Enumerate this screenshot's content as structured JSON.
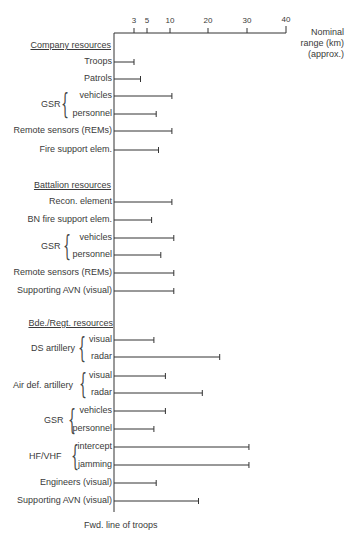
{
  "chart_data": {
    "type": "bar",
    "orientation": "horizontal",
    "title": "",
    "xlabel": "Nominal range (km) (approx.)",
    "ylabel": "",
    "x_ticks": [
      3,
      5,
      10,
      20,
      30,
      40
    ],
    "xlim": [
      0,
      40
    ],
    "grid": false,
    "legend": null,
    "footer": "Fwd. line of troops",
    "groups": [
      {
        "name": "Company resources",
        "items": [
          {
            "label": "Troops",
            "value": 3
          },
          {
            "label": "Patrols",
            "value": 4
          },
          {
            "label": "vehicles",
            "parent": "GSR",
            "value": 10.5
          },
          {
            "label": "personnel",
            "parent": "GSR",
            "value": 7
          },
          {
            "label": "Remote sensors (REMs)",
            "value": 10.5
          },
          {
            "label": "Fire support elem.",
            "value": 7.5
          }
        ]
      },
      {
        "name": "Battalion resources",
        "items": [
          {
            "label": "Recon. element",
            "value": 10.5
          },
          {
            "label": "BN fire support elem.",
            "value": 6
          },
          {
            "label": "vehicles",
            "parent": "GSR",
            "value": 11
          },
          {
            "label": "personnel",
            "parent": "GSR",
            "value": 8
          },
          {
            "label": "Remote sensors (REMs)",
            "value": 11
          },
          {
            "label": "Supporting AVN  (visual)",
            "value": 11
          }
        ]
      },
      {
        "name": "Bde./Regt. resources",
        "items": [
          {
            "label": "visual",
            "parent": "DS artillery",
            "value": 6.5
          },
          {
            "label": "radar",
            "parent": "DS artillery",
            "value": 23
          },
          {
            "label": "visual",
            "parent": "Air def. artillery",
            "value": 9
          },
          {
            "label": "radar",
            "parent": "Air def. artillery",
            "value": 18.5
          },
          {
            "label": "vehicles",
            "parent": "GSR",
            "value": 9
          },
          {
            "label": "personnel",
            "parent": "GSR",
            "value": 6.5
          },
          {
            "label": "intercept",
            "parent": "HF/VHF",
            "value": 30.5
          },
          {
            "label": "jamming",
            "parent": "HF/VHF",
            "value": 30.5
          },
          {
            "label": "Engineers  (visual)",
            "value": 7
          },
          {
            "label": "Supporting AVN (visual)",
            "value": 17.5
          }
        ]
      }
    ]
  },
  "axis": {
    "units_line1": "Nominal",
    "units_line2": "range (km)",
    "units_line3": "(approx.)",
    "ticks": [
      "3",
      "5",
      "10",
      "20",
      "30",
      "40"
    ]
  },
  "headers": {
    "company": "Company resources",
    "battalion": "Battalion resources",
    "brigade": "Bde./Regt. resources"
  },
  "brace_labels": {
    "gsr1": "GSR",
    "gsr2": "GSR",
    "ds": "DS artillery",
    "ad": "Air def. artillery",
    "gsr3": "GSR",
    "hf": "HF/VHF"
  },
  "footer": "Fwd. line of troops",
  "rows": [
    {
      "label": "Troops",
      "y": 62,
      "value": 3
    },
    {
      "label": "Patrols",
      "y": 79,
      "value": 4
    },
    {
      "label": "vehicles",
      "y": 96,
      "value": 10.5
    },
    {
      "label": "personnel",
      "y": 114,
      "value": 7
    },
    {
      "label": "Remote sensors (REMs)",
      "y": 131,
      "value": 10.5
    },
    {
      "label": "Fire support elem.",
      "y": 150,
      "value": 7.5
    },
    {
      "label": "Recon. element",
      "y": 202,
      "value": 10.5
    },
    {
      "label": "BN fire support elem.",
      "y": 220,
      "value": 6
    },
    {
      "label": "vehicles",
      "y": 238,
      "value": 11
    },
    {
      "label": "personnel",
      "y": 255,
      "value": 8
    },
    {
      "label": "Remote sensors (REMs)",
      "y": 273,
      "value": 11
    },
    {
      "label": "Supporting AVN  (visual)",
      "y": 291,
      "value": 11
    },
    {
      "label": "visual",
      "y": 340,
      "value": 6.5
    },
    {
      "label": "radar",
      "y": 357,
      "value": 23
    },
    {
      "label": "visual",
      "y": 376,
      "value": 9
    },
    {
      "label": "radar",
      "y": 393,
      "value": 18.5
    },
    {
      "label": "vehicles",
      "y": 411,
      "value": 9
    },
    {
      "label": "personnel",
      "y": 429,
      "value": 6.5
    },
    {
      "label": "intercept",
      "y": 447,
      "value": 30.5
    },
    {
      "label": "jamming",
      "y": 465,
      "value": 30.5
    },
    {
      "label": "Engineers  (visual)",
      "y": 483,
      "value": 7
    },
    {
      "label": "Supporting AVN (visual)",
      "y": 501,
      "value": 17.5
    }
  ]
}
